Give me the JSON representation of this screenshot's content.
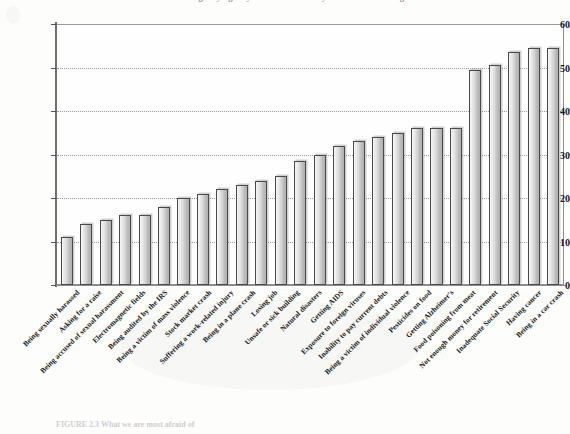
{
  "title": "Percentage saying they are 'afraid' or 'very afraid' of each thing",
  "caption": "FIGURE 2.3  What we are most afraid of",
  "axis": {
    "y_ticks": [
      "0",
      "10",
      "20",
      "30",
      "40",
      "50",
      "60"
    ],
    "y_min": 0,
    "y_max": 60,
    "y_step": 10
  },
  "chart_data": {
    "type": "bar",
    "title": "Percentage saying they are 'afraid' or 'very afraid' of each thing",
    "xlabel": "",
    "ylabel": "",
    "ylim": [
      0,
      60
    ],
    "ytick_step": 10,
    "grid": true,
    "legend": "none",
    "orientation": "vertical",
    "sorted": "ascending",
    "categories": [
      "Being sexually harassed",
      "Asking for a raise",
      "Being accused of sexual harassment",
      "Electromagnetic fields",
      "Being audited by the IRS",
      "Being a victim of mass violence",
      "Stock market crash",
      "Suffering a work-related injury",
      "Being in a plane crash",
      "Losing job",
      "Unsafe or sick building",
      "Natural disasters",
      "Getting AIDS",
      "Exposure to foreign viruses",
      "Inability to pay current debts",
      "Being a victim of individual violence",
      "Pesticides on food",
      "Getting Alzheimer's",
      "Food poisoning from meat",
      "Not enough money for retirement",
      "Inadequate Social Security",
      "Having cancer",
      "Being in a car crash"
    ],
    "values": [
      11,
      14,
      15,
      16,
      16,
      18,
      20,
      21,
      22,
      23,
      24,
      25,
      28.5,
      30,
      32,
      33,
      34,
      35,
      36,
      49.5,
      50.5,
      53.5,
      54.5
    ]
  },
  "bars": {
    "count": 26,
    "values": [
      11,
      14,
      15,
      16,
      16,
      18,
      20,
      21,
      22,
      23,
      24,
      25,
      28.5,
      30,
      32,
      33,
      34,
      35,
      36,
      36,
      36,
      49.5,
      50.5,
      53.5,
      54.5,
      54.5
    ],
    "labels": [
      "Being sexually harassed",
      "Asking for a raise",
      "Being accused of sexual harassment",
      "Electromagnetic fields",
      "Being audited by the IRS",
      "Being a victim of mass violence",
      "Stock market crash",
      "Suffering a work-related injury",
      "Being in a plane crash",
      "Losing job",
      "Unsafe or sick building",
      "Natural disasters",
      "Getting AIDS",
      "Exposure to foreign viruses",
      "Inability to pay current debts",
      "Being a victim of individual violence",
      "Pesticides on food",
      "Getting Alzheimer's",
      "Food poisoning from meat",
      "Not enough money for retirement",
      "Inadequate Social Security",
      "Having cancer",
      "Being in a car crash"
    ]
  },
  "colors": {
    "bar_fill_light": "#f2f2f2",
    "bar_fill_dark": "#b0b0b0",
    "bar_outline": "#4a4a4a",
    "grid": "#9b9b9b",
    "axis": "#6f6f6f",
    "text": "#151515",
    "background": "#fdfdfc"
  }
}
